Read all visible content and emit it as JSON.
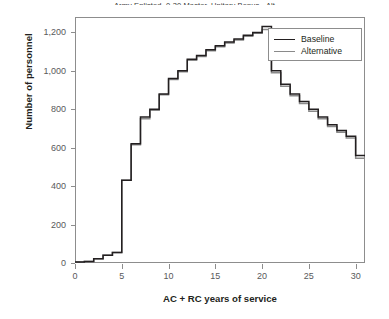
{
  "chart_data": {
    "type": "line",
    "subtype": "step",
    "title": "Army Enlisted, 0-30 Master, Unitary Bonus - Alt",
    "xlabel": "AC + RC years of service",
    "ylabel": "Number of personnel",
    "xlim": [
      0,
      31
    ],
    "ylim": [
      0,
      1280
    ],
    "xticks": [
      0,
      5,
      10,
      15,
      20,
      25,
      30
    ],
    "xtick_labels": [
      "0",
      "5",
      "10",
      "15",
      "20",
      "25",
      "30"
    ],
    "yticks": [
      0,
      200,
      400,
      600,
      800,
      1000,
      1200
    ],
    "ytick_labels": [
      "0",
      "200",
      "400",
      "600",
      "800",
      "1,000",
      "1,200"
    ],
    "grid": false,
    "legend_position": "top-right",
    "x": [
      0,
      1,
      2,
      3,
      4,
      5,
      6,
      7,
      8,
      9,
      10,
      11,
      12,
      13,
      14,
      15,
      16,
      17,
      18,
      19,
      20,
      21,
      22,
      23,
      24,
      25,
      26,
      27,
      28,
      29,
      30
    ],
    "series": [
      {
        "name": "Baseline",
        "color": "#231f20",
        "values": [
          5,
          8,
          22,
          40,
          55,
          430,
          620,
          760,
          800,
          880,
          960,
          1000,
          1060,
          1080,
          1110,
          1130,
          1150,
          1165,
          1185,
          1200,
          1230,
          1000,
          930,
          880,
          840,
          800,
          760,
          720,
          690,
          660,
          560
        ]
      },
      {
        "name": "Alternative",
        "color": "#8a8a8a",
        "values": [
          5,
          8,
          22,
          40,
          55,
          430,
          615,
          750,
          795,
          875,
          955,
          995,
          1055,
          1075,
          1105,
          1125,
          1145,
          1160,
          1180,
          1195,
          1215,
          990,
          920,
          870,
          830,
          790,
          750,
          710,
          680,
          650,
          545
        ]
      }
    ]
  },
  "legend": {
    "items": [
      {
        "label": "Baseline",
        "color": "#231f20"
      },
      {
        "label": "Alternative",
        "color": "#8a8a8a"
      }
    ]
  }
}
